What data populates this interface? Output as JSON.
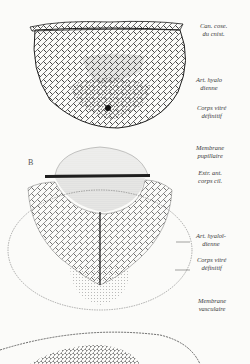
{
  "figure": {
    "panel_b_letter": "B",
    "labels_top": [
      {
        "line1": "Can. cose.",
        "line2": "du cnist."
      },
      {
        "line1": "Art. hyalo",
        "line2": "dienne"
      },
      {
        "line1": "Corps vitré",
        "line2": "définitif"
      }
    ],
    "labels_middle": [
      {
        "line1": "Membrane",
        "line2": "pupillaire"
      },
      {
        "line1": "Extr. ant.",
        "line2": "corps cil."
      },
      {
        "line1": "Art. hyaloï-",
        "line2": "dienne"
      },
      {
        "line1": "Corps vitré",
        "line2": "définitif"
      },
      {
        "line1": "Membrane",
        "line2": "vasculaire"
      }
    ]
  },
  "colors": {
    "ink": "#1e1e1e",
    "paper": "#fbfbf9"
  }
}
